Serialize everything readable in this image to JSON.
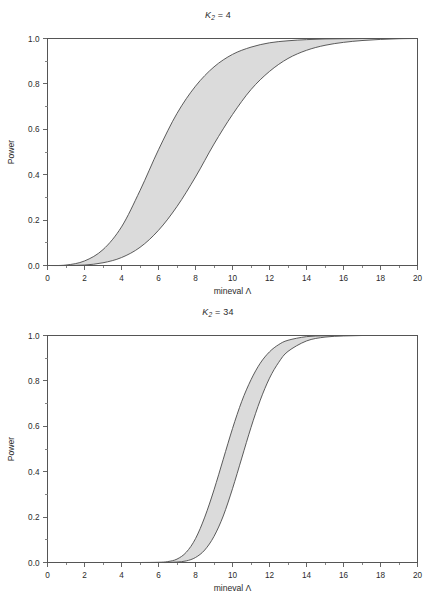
{
  "figure": {
    "background_color": "#ffffff",
    "band_fill_color": "#d9d9d9",
    "band_edge_color": "#4a4a4a",
    "axis_color": "#555555"
  },
  "panels": [
    {
      "id": "top",
      "title_prefix": "K",
      "title_subscript": "2",
      "title_value": " = 4",
      "title_full": "K2 = 4"
    },
    {
      "id": "bottom",
      "title_prefix": "K",
      "title_subscript": "2",
      "title_value": " = 34",
      "title_full": "K2 = 34"
    }
  ],
  "axes": {
    "x_tick_labels": [
      "0",
      "2",
      "4",
      "6",
      "8",
      "10",
      "12",
      "14",
      "16",
      "18",
      "20"
    ],
    "y_tick_labels": [
      "0.0",
      "0.2",
      "0.4",
      "0.6",
      "0.8",
      "1.0"
    ],
    "x_axis_title": "mineval Λ",
    "y_axis_title": "Power"
  },
  "chart_data": [
    {
      "type": "area",
      "title": "K2 = 4",
      "xlabel": "mineval Λ",
      "ylabel": "Power",
      "xlim": [
        0,
        20
      ],
      "ylim": [
        0,
        1
      ],
      "xticks": [
        0,
        2,
        4,
        6,
        8,
        10,
        12,
        14,
        16,
        18,
        20
      ],
      "yticks": [
        0.0,
        0.2,
        0.4,
        0.6,
        0.8,
        1.0
      ],
      "x_minor_tick_step": 1,
      "y_minor_tick_step": 0.1,
      "grid": false,
      "legend": "none",
      "shaded_band": {
        "description": "Region between upper (left) and lower (right) power curves",
        "fill": "#d9d9d9",
        "x": [
          0,
          1,
          2,
          3,
          4,
          5,
          6,
          7,
          8,
          9,
          10,
          11,
          12,
          13,
          14,
          15,
          16,
          17,
          18,
          19,
          20
        ],
        "upper": [
          0.0,
          0.002,
          0.02,
          0.07,
          0.17,
          0.33,
          0.51,
          0.67,
          0.79,
          0.875,
          0.93,
          0.962,
          0.981,
          0.99,
          0.995,
          0.998,
          0.999,
          1.0,
          1.0,
          1.0,
          1.0
        ],
        "lower": [
          0.0,
          0.0,
          0.002,
          0.012,
          0.035,
          0.08,
          0.155,
          0.26,
          0.39,
          0.535,
          0.665,
          0.775,
          0.855,
          0.912,
          0.948,
          0.97,
          0.983,
          0.991,
          0.996,
          0.999,
          1.0
        ]
      }
    },
    {
      "type": "area",
      "title": "K2 = 34",
      "xlabel": "mineval Λ",
      "ylabel": "Power",
      "xlim": [
        0,
        20
      ],
      "ylim": [
        0,
        1
      ],
      "xticks": [
        0,
        2,
        4,
        6,
        8,
        10,
        12,
        14,
        16,
        18,
        20
      ],
      "yticks": [
        0.0,
        0.2,
        0.4,
        0.6,
        0.8,
        1.0
      ],
      "x_minor_tick_step": 1,
      "y_minor_tick_step": 0.1,
      "grid": false,
      "legend": "none",
      "shaded_band": {
        "description": "Region between upper (left) and lower (right) power curves",
        "fill": "#d9d9d9",
        "x": [
          0,
          1,
          2,
          3,
          4,
          5,
          6,
          6.5,
          7,
          7.5,
          8,
          8.5,
          9,
          9.5,
          10,
          10.5,
          11,
          11.5,
          12,
          12.5,
          13,
          14,
          15,
          16,
          17,
          18,
          19,
          20
        ],
        "upper": [
          0.0,
          0.0,
          0.0,
          0.0,
          0.0,
          0.0,
          0.001,
          0.004,
          0.015,
          0.045,
          0.105,
          0.2,
          0.32,
          0.455,
          0.59,
          0.71,
          0.805,
          0.878,
          0.928,
          0.96,
          0.979,
          0.995,
          0.999,
          1.0,
          1.0,
          1.0,
          1.0,
          1.0
        ],
        "lower": [
          0.0,
          0.0,
          0.0,
          0.0,
          0.0,
          0.0,
          0.0,
          0.0,
          0.002,
          0.007,
          0.022,
          0.055,
          0.115,
          0.205,
          0.325,
          0.46,
          0.595,
          0.715,
          0.812,
          0.882,
          0.93,
          0.976,
          0.993,
          0.998,
          1.0,
          1.0,
          1.0,
          1.0
        ]
      }
    }
  ]
}
